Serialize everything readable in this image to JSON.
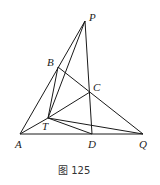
{
  "figure": {
    "caption": "图 125",
    "points": {
      "P": {
        "label": "P",
        "x": 85,
        "y": 21
      },
      "B": {
        "label": "B",
        "x": 58,
        "y": 67
      },
      "C": {
        "label": "C",
        "x": 90,
        "y": 92
      },
      "T": {
        "label": "T",
        "x": 48,
        "y": 118
      },
      "A": {
        "label": "A",
        "x": 20,
        "y": 134
      },
      "D": {
        "label": "D",
        "x": 92,
        "y": 134
      },
      "Q": {
        "label": "Q",
        "x": 143,
        "y": 134
      }
    },
    "segments": [
      "AP",
      "AQ",
      "PD",
      "PT",
      "BT",
      "BQ",
      "TC",
      "TQ",
      "TD",
      "AT"
    ],
    "line_color": "#1a1a1a"
  }
}
